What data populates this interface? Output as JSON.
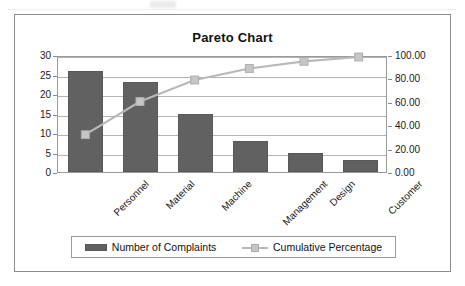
{
  "chart_data": {
    "type": "bar",
    "title": "Pareto Chart",
    "categories": [
      "Personnel",
      "Material",
      "Machine",
      "Management",
      "Design",
      "Customer"
    ],
    "series": [
      {
        "name": "Number of Complaints",
        "type": "bar",
        "axis": "left",
        "values": [
          26,
          23,
          15,
          8,
          5,
          3
        ],
        "color": "#616161"
      },
      {
        "name": "Cumulative Percentage",
        "type": "line",
        "axis": "right",
        "values": [
          32.5,
          61.25,
          80.0,
          90.0,
          96.25,
          100.0
        ],
        "color": "#b9b9b9"
      }
    ],
    "xlabel": "",
    "ylabel": "",
    "y_left": {
      "min": 0,
      "max": 30,
      "step": 5,
      "ticks": [
        "0",
        "5",
        "10",
        "15",
        "20",
        "25",
        "30"
      ]
    },
    "y_right": {
      "min": 0,
      "max": 100,
      "step": 20,
      "ticks": [
        "0.00",
        "20.00",
        "40.00",
        "60.00",
        "80.00",
        "100.00"
      ]
    },
    "grid": true,
    "legend_position": "bottom",
    "legend": [
      "Number of Complaints",
      "Cumulative Percentage"
    ]
  },
  "legend": {
    "bar_series_label": "Number of Complaints",
    "line_series_label": "Cumulative Percentage"
  },
  "colors": {
    "bar_fill": "#616161",
    "line_stroke": "#b9b9b9",
    "marker_fill": "#c6c6c6",
    "gridline": "#b4b4b4",
    "frame_border": "#8c8c8c",
    "text": "#1a1a1a"
  }
}
